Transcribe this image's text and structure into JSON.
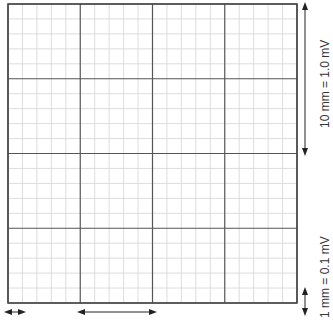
{
  "grid": {
    "left": 8,
    "top": 4,
    "right": 297,
    "bottom": 303,
    "major_divisions": 4,
    "minor_per_major": 5,
    "major_color": "#555555",
    "minor_color": "#d4d4d4",
    "border_color": "#444444"
  },
  "annotations": {
    "large_scale_label": "10 mm = 1.0 mV",
    "small_scale_label": "1 mm = 0.1 mV"
  },
  "arrows": {
    "vertical_large": {
      "x": 305,
      "y1": 6,
      "y2": 152
    },
    "vertical_small": {
      "x": 305,
      "y1": 291,
      "y2": 312
    },
    "horizontal_small": {
      "y": 312,
      "x1": 8,
      "x2": 22
    },
    "horizontal_large": {
      "y": 312,
      "x1": 81,
      "x2": 153
    }
  }
}
